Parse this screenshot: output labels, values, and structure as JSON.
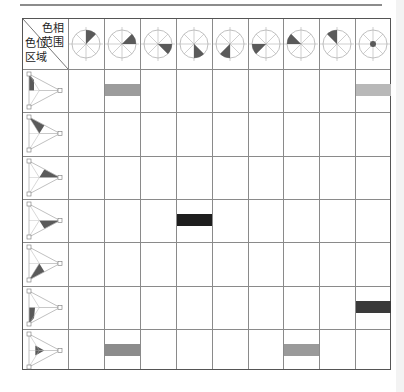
{
  "header": {
    "corner_top_line1": "色相",
    "corner_top_line2": "范围",
    "corner_bottom_line1": "色位",
    "corner_bottom_line2": "区域"
  },
  "hue_columns": [
    {
      "id": "h1",
      "sector": [
        0,
        45
      ]
    },
    {
      "id": "h2",
      "sector": [
        45,
        90
      ]
    },
    {
      "id": "h3",
      "sector": [
        90,
        135
      ]
    },
    {
      "id": "h4",
      "sector": [
        135,
        180
      ]
    },
    {
      "id": "h5",
      "sector": [
        180,
        225
      ]
    },
    {
      "id": "h6",
      "sector": [
        225,
        270
      ]
    },
    {
      "id": "h7",
      "sector": [
        270,
        315
      ]
    },
    {
      "id": "h8",
      "sector": [
        315,
        360
      ]
    },
    {
      "id": "h9",
      "sector": "center"
    }
  ],
  "position_rows": [
    {
      "id": "p1",
      "region": "left-edge-top"
    },
    {
      "id": "p2",
      "region": "upper-left"
    },
    {
      "id": "p3",
      "region": "upper-right"
    },
    {
      "id": "p4",
      "region": "lower-right"
    },
    {
      "id": "p5",
      "region": "lower-left"
    },
    {
      "id": "p6",
      "region": "left-edge-bottom"
    },
    {
      "id": "p7",
      "region": "center"
    }
  ],
  "marks": [
    {
      "row": 0,
      "col": 1,
      "color": "#9c9c9c"
    },
    {
      "row": 0,
      "col": 8,
      "color": "#b8b8b8"
    },
    {
      "row": 3,
      "col": 3,
      "color": "#1e1e1e"
    },
    {
      "row": 5,
      "col": 8,
      "color": "#3a3a3a"
    },
    {
      "row": 6,
      "col": 1,
      "color": "#8c8c8c"
    },
    {
      "row": 6,
      "col": 6,
      "color": "#9a9a9a"
    }
  ],
  "colors": {
    "sector_fill": "#5a5a5a",
    "line": "#b0b0b0",
    "grid": "#8a8a8a"
  }
}
